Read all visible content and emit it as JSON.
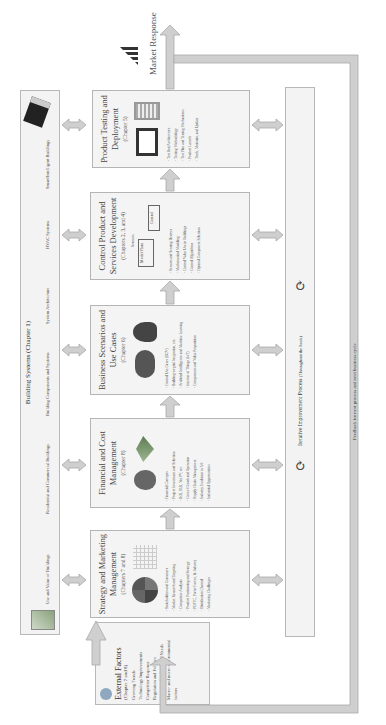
{
  "page_number": "xxvi",
  "building_systems": {
    "title": "Building Systems (Chapter 1)",
    "items": [
      "Use and Value of Buildings",
      "Residential and Commercial Buildings",
      "Building Components and Systems",
      "System Architecture",
      "HVAC Systems",
      "Smart/Intelligent Buildings"
    ]
  },
  "external_factors": {
    "title": "External Factors",
    "chapter": "(Chapter 7 and 8)",
    "items": [
      "Growing Trends",
      "Technology Improvements",
      "Competitor Response",
      "Regulation and Policies",
      "Customer Feedback and Needs",
      "Macro- and micro-environmental factors"
    ]
  },
  "boxes": [
    {
      "title": "Strategy and Marketing Management",
      "chapter": "(Chapters 7 and 8)",
      "icons": [
        "swot-icon",
        "grid-matrix-icon"
      ],
      "items": [
        "Stakeholders and Customers",
        "Market Research and Targeting",
        "Competitor Analysis",
        "Product Positioning and Strategy",
        "PESTC, Porter Forces, & Industry",
        "Distribution Channel",
        "Marketing Challenges"
      ]
    },
    {
      "title": "Financial and Cost Management",
      "chapter": "(Chapter 8)",
      "icons": [
        "money-bag-icon",
        "money-wings-icon"
      ],
      "items": [
        "Financial Concepts",
        "Project Investment and Selection",
        "ROI, IRR, Net PV, etc.",
        "Cost of Goods and Operation",
        "Supply Chain Management",
        "Industry Evolution to 5.0",
        "Industrial Opportunities"
      ]
    },
    {
      "title": "Business Scenarios and Use Cases",
      "chapter": "(Chapter 6)",
      "icons": [
        "cloud-network-icon",
        "head-gears-icon"
      ],
      "items": [
        "Control Use Cases (DCV)",
        "Building-to-grid Integration, etc.",
        "Artificial Intelligence and Machine Learning",
        "Internet of Things (IoT)",
        "Components and Value Proposition"
      ]
    },
    {
      "title": "Control Product and Services Development",
      "chapter": "(Chapters 2, 3, and 4)",
      "diagram": {
        "sensors": "Sensors",
        "plant": "Model/Plant",
        "control": "Control"
      },
      "items": [
        "Sensors and Sensing Devices",
        "Mathematical Modeling",
        "Control Value Use in Buildings",
        "Control Algorithms",
        "Optimal Component Selection"
      ]
    },
    {
      "title": "Product Testing and Deployment",
      "chapter": "(Chapter 5)",
      "icons": [
        "monitor-chart-icon",
        "server-battery-icon"
      ],
      "items": [
        "Test Bed Architecture",
        "Testing Methodology",
        "Test Plan and Testing Mechanisms",
        "Product Launch",
        "Track, Maintain, and Update"
      ]
    }
  ],
  "iterative": {
    "label": "Iterative Improvement Process",
    "note": "(Throughout the book)"
  },
  "market_response": "Market Response",
  "feedback": "Feedback for next process and next business cycle",
  "colors": {
    "arrow": "#c9c9c9",
    "arrow_edge": "#a8a8a8",
    "panel": "#f3f3f3",
    "border": "#b8b8b8"
  }
}
